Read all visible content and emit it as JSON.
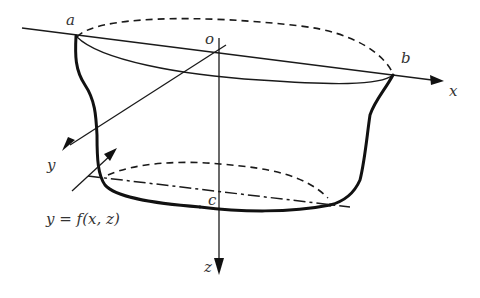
{
  "diagram": {
    "labels": {
      "a": "a",
      "b": "b",
      "o": "o",
      "c": "c",
      "x": "x",
      "y": "y",
      "z": "z",
      "surface_equation": "y = f(x, z)"
    },
    "elements": [
      "x-axis",
      "y-axis",
      "z-axis",
      "top-rim-dashed-back",
      "top-rim-front",
      "bottom-rim-dashed-back",
      "bottom-chord-dashdot",
      "left-profile-thick",
      "right-profile-thick",
      "bottom-profile-thick",
      "surface-pointer-arrow"
    ],
    "colors": {
      "ink": "#111111",
      "background": "#ffffff"
    }
  }
}
